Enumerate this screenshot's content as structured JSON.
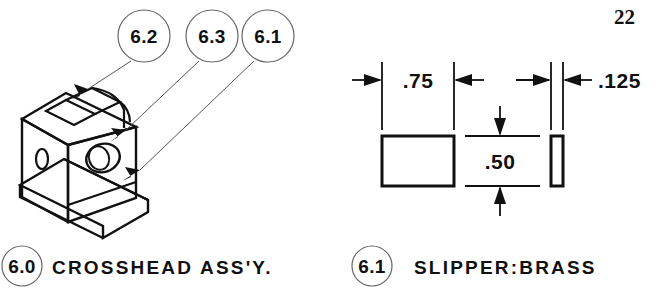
{
  "page": {
    "number": "22",
    "background_color": "#ffffff",
    "ink_color": "#111111"
  },
  "figures": [
    {
      "id": "crosshead-assembly",
      "caption_balloon": "6.0",
      "caption_text": "CROSSHEAD  ASS'Y.",
      "view": "isometric",
      "callouts": [
        {
          "balloon": "6.2",
          "cx": 144,
          "cy": 36,
          "r": 26
        },
        {
          "balloon": "6.3",
          "cx": 212,
          "cy": 36,
          "r": 26
        },
        {
          "balloon": "6.1",
          "cx": 268,
          "cy": 36,
          "r": 26
        }
      ]
    },
    {
      "id": "slipper-detail",
      "caption_balloon": "6.1",
      "caption_text": "SLIPPER:BRASS",
      "view": "orthographic",
      "dimensions": [
        {
          "label": ".75",
          "orientation": "horizontal",
          "applies_to": "front-view-width"
        },
        {
          "label": ".50",
          "orientation": "vertical",
          "applies_to": "height"
        },
        {
          "label": ".125",
          "orientation": "horizontal",
          "applies_to": "side-view-thickness"
        }
      ]
    }
  ]
}
